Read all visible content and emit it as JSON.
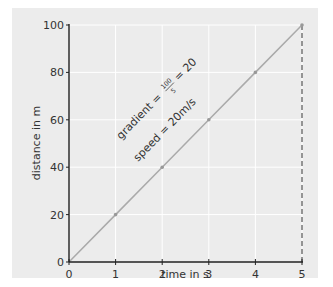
{
  "chart_data": {
    "type": "line",
    "title": "",
    "xlabel": "time in s",
    "ylabel": "distance in m",
    "xlim": [
      0,
      5
    ],
    "ylim": [
      0,
      100
    ],
    "x_ticks": [
      "0",
      "1",
      "2",
      "3",
      "4",
      "5"
    ],
    "y_ticks": [
      "0",
      "20",
      "40",
      "60",
      "80",
      "100"
    ],
    "grid": true,
    "legend": null,
    "series": [
      {
        "name": "distance-time",
        "x": [
          0,
          1,
          2,
          3,
          4,
          5
        ],
        "y": [
          0,
          20,
          40,
          60,
          80,
          100
        ]
      }
    ],
    "annotations": {
      "gradient_prefix": "gradient =",
      "gradient_numerator": "100",
      "gradient_denominator": "5",
      "gradient_suffix": "= 20",
      "speed": "speed = 20m/s"
    },
    "reference_line": {
      "type": "dashed-vertical",
      "x": 5,
      "from_y": 0,
      "to_y": 100
    }
  },
  "colors": {
    "panel_background": "#ececec",
    "grid": "#ffffff",
    "line": "#aaaaaa",
    "axis": "#222222",
    "text": "#333333"
  }
}
